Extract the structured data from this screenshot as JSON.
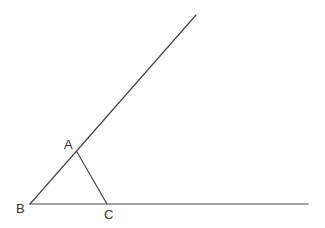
{
  "diagram": {
    "title": "",
    "colors": {
      "line": "#444444",
      "label": "#333333",
      "background": "#ffffff"
    },
    "points": {
      "A": {
        "label": "A",
        "x": 77,
        "y": 152
      },
      "B": {
        "label": "B",
        "x": 30,
        "y": 204
      },
      "C": {
        "label": "C",
        "x": 107,
        "y": 204
      }
    },
    "rays": [
      {
        "name": "ray-BA",
        "from": "B",
        "through": "A",
        "end": {
          "x": 196,
          "y": 15
        }
      },
      {
        "name": "ray-BC",
        "from": "B",
        "through": "C",
        "end": {
          "x": 308,
          "y": 204
        }
      }
    ],
    "segments": [
      {
        "name": "segment-AC",
        "from": "A",
        "to": "C"
      }
    ]
  }
}
